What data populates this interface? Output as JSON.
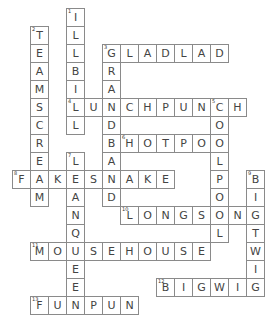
{
  "puzzle": {
    "type": "crossword",
    "cell_size": 18,
    "words": [
      {
        "number": "1",
        "answer": "ILLBILL",
        "direction": "down",
        "row": 0,
        "col": 3
      },
      {
        "number": "2",
        "answer": "TEAMSCREAM",
        "direction": "down",
        "row": 1,
        "col": 1
      },
      {
        "number": "3",
        "answer": "GLADLAD",
        "direction": "across",
        "row": 2,
        "col": 5
      },
      {
        "number": "3",
        "answer": "GRANDBAND",
        "direction": "down",
        "row": 2,
        "col": 5
      },
      {
        "number": "4",
        "answer": "LUNCHPUNCH",
        "direction": "across",
        "row": 5,
        "col": 3
      },
      {
        "number": "5",
        "answer": "COOLPOOL",
        "direction": "down",
        "row": 5,
        "col": 11
      },
      {
        "number": "6",
        "answer": "HOTPOT",
        "direction": "across",
        "row": 7,
        "col": 6
      },
      {
        "number": "7",
        "answer": "LEANQUEEN",
        "direction": "down",
        "row": 8,
        "col": 3
      },
      {
        "number": "8",
        "answer": "FAKESNAKE",
        "direction": "across",
        "row": 9,
        "col": 0
      },
      {
        "number": "9",
        "answer": "BIGTWIG",
        "direction": "down",
        "row": 9,
        "col": 13
      },
      {
        "number": "10",
        "answer": "LONGSONG",
        "direction": "across",
        "row": 11,
        "col": 6
      },
      {
        "number": "11",
        "answer": "MOUSEHOUSE",
        "direction": "across",
        "row": 13,
        "col": 1
      },
      {
        "number": "12",
        "answer": "BIGWIG",
        "direction": "across",
        "row": 15,
        "col": 8
      },
      {
        "number": "13",
        "answer": "FUNPUN",
        "direction": "across",
        "row": 16,
        "col": 1
      }
    ]
  }
}
